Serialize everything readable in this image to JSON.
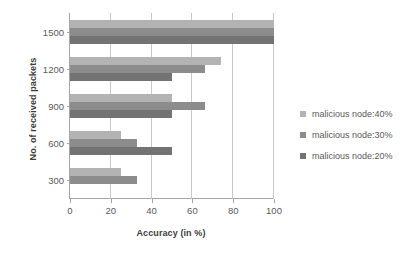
{
  "chart_data": {
    "type": "bar",
    "orientation": "horizontal",
    "title": "",
    "xlabel": "Accuracy (in %)",
    "ylabel": "No. of received packets",
    "categories": [
      "1500",
      "1200",
      "900",
      "600",
      "300"
    ],
    "xlim": [
      0,
      100
    ],
    "xticks": [
      "0",
      "20",
      "40",
      "60",
      "80",
      "100"
    ],
    "grid": true,
    "legend_position": "right",
    "series": [
      {
        "name": "malicious node:40%",
        "color": "#b3b3b3",
        "values": [
          100,
          74,
          50,
          25,
          25
        ]
      },
      {
        "name": "malicious node:30%",
        "color": "#8c8c8c",
        "values": [
          100,
          66,
          66,
          33,
          33
        ]
      },
      {
        "name": "malicious node:20%",
        "color": "#737373",
        "values": [
          100,
          50,
          50,
          50,
          0
        ]
      }
    ]
  },
  "axis": {
    "x_title": "Accuracy (in %)",
    "y_title": "No. of received packets"
  },
  "colors": {
    "axis_line": "#a6a6a6",
    "gridline": "#c9c9c9",
    "text": "#5a5a5a",
    "title_text": "#3d3d3d"
  }
}
